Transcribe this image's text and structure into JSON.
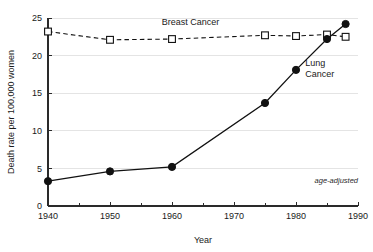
{
  "chart_data": {
    "type": "line",
    "title": "",
    "xlabel": "Year",
    "ylabel": "Death rate per 100,000 women",
    "xlim": [
      1940,
      1990
    ],
    "ylim": [
      0,
      25
    ],
    "xticks": [
      1940,
      1950,
      1960,
      1970,
      1980,
      1990
    ],
    "xtick_labels": [
      "1940",
      "1950",
      "1960",
      "1970",
      "1980",
      "1990"
    ],
    "xminor_ticks": [
      1945,
      1955,
      1965,
      1975,
      1985
    ],
    "yticks": [
      0,
      5,
      10,
      15,
      20,
      25
    ],
    "ytick_labels": [
      "0",
      "5",
      "10",
      "15",
      "20",
      "25"
    ],
    "grid": "horizontal",
    "legend_position": "inline-annotations",
    "annotations": [
      {
        "text": "Breast Cancer",
        "x": 1963,
        "y": 24.1
      },
      {
        "text": "Lung",
        "x": 1981.5,
        "y": 18.6
      },
      {
        "text": "Cancer",
        "x": 1981.5,
        "y": 17.1
      },
      {
        "text": "age-adjusted",
        "x": 1986.5,
        "y": 3.0
      }
    ],
    "series": [
      {
        "name": "Breast Cancer",
        "marker": "open-square",
        "linestyle": "dashed",
        "x": [
          1940,
          1950,
          1960,
          1975,
          1980,
          1985,
          1988
        ],
        "values": [
          23.2,
          22.1,
          22.2,
          22.7,
          22.6,
          22.8,
          22.5
        ]
      },
      {
        "name": "Lung Cancer",
        "marker": "filled-circle",
        "linestyle": "solid",
        "x": [
          1940,
          1950,
          1960,
          1975,
          1980,
          1985,
          1988
        ],
        "values": [
          3.3,
          4.6,
          5.2,
          13.7,
          18.1,
          22.2,
          24.2
        ]
      }
    ]
  },
  "colors": {
    "ink": "#111111",
    "grid": "#e4e4e4",
    "background": "#ffffff"
  }
}
